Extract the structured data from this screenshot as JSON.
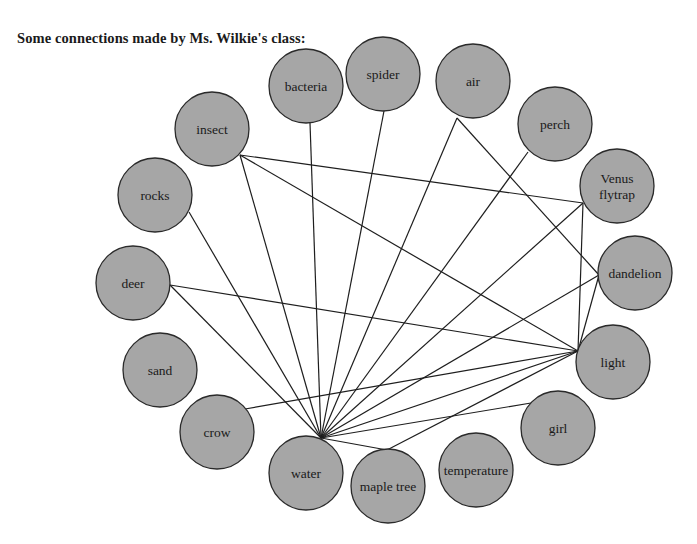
{
  "title": "Some connections made by Ms. Wilkie's class:",
  "colors": {
    "node_fill": "#a6a6a6",
    "node_stroke": "#2a2a2a",
    "edge": "#1e1e1e"
  },
  "nodes": [
    {
      "id": "bacteria",
      "label": "bacteria",
      "cx": 306,
      "cy": 86,
      "r": 37
    },
    {
      "id": "spider",
      "label": "spider",
      "cx": 383,
      "cy": 74,
      "r": 37
    },
    {
      "id": "air",
      "label": "air",
      "cx": 473,
      "cy": 81,
      "r": 37
    },
    {
      "id": "perch",
      "label": "perch",
      "cx": 555,
      "cy": 124,
      "r": 37
    },
    {
      "id": "insect",
      "label": "insect",
      "cx": 212,
      "cy": 129,
      "r": 37
    },
    {
      "id": "venus-flytrap",
      "label": "Venus flytrap",
      "lines": [
        "Venus",
        "flytrap"
      ],
      "cx": 617,
      "cy": 186,
      "r": 37
    },
    {
      "id": "rocks",
      "label": "rocks",
      "cx": 155,
      "cy": 195,
      "r": 37
    },
    {
      "id": "dandelion",
      "label": "dandelion",
      "cx": 635,
      "cy": 273,
      "r": 37
    },
    {
      "id": "deer",
      "label": "deer",
      "cx": 133,
      "cy": 283,
      "r": 37
    },
    {
      "id": "light",
      "label": "light",
      "cx": 613,
      "cy": 362,
      "r": 37
    },
    {
      "id": "sand",
      "label": "sand",
      "cx": 160,
      "cy": 370,
      "r": 37
    },
    {
      "id": "girl",
      "label": "girl",
      "cx": 558,
      "cy": 428,
      "r": 37
    },
    {
      "id": "crow",
      "label": "crow",
      "cx": 217,
      "cy": 432,
      "r": 37
    },
    {
      "id": "water",
      "label": "water",
      "cx": 306,
      "cy": 473,
      "r": 37
    },
    {
      "id": "maple-tree",
      "label": "maple tree",
      "cx": 388,
      "cy": 486,
      "r": 37
    },
    {
      "id": "temperature",
      "label": "temperature",
      "cx": 476,
      "cy": 470,
      "r": 37
    }
  ],
  "edges": [
    {
      "from": "bacteria",
      "to": "water",
      "x1": 310,
      "y1": 123,
      "x2": 321,
      "y2": 438
    },
    {
      "from": "spider",
      "to": "water",
      "x1": 384,
      "y1": 111,
      "x2": 321,
      "y2": 438
    },
    {
      "from": "air",
      "to": "water",
      "x1": 457,
      "y1": 118,
      "x2": 321,
      "y2": 438
    },
    {
      "from": "air",
      "to": "dandelion",
      "x1": 457,
      "y1": 118,
      "x2": 599,
      "y2": 275
    },
    {
      "from": "perch",
      "to": "water",
      "x1": 528,
      "y1": 152,
      "x2": 321,
      "y2": 438
    },
    {
      "from": "insect",
      "to": "water",
      "x1": 240,
      "y1": 155,
      "x2": 321,
      "y2": 438
    },
    {
      "from": "insect",
      "to": "venus-flytrap",
      "x1": 240,
      "y1": 155,
      "x2": 583,
      "y2": 203
    },
    {
      "from": "insect",
      "to": "light",
      "x1": 240,
      "y1": 155,
      "x2": 578,
      "y2": 351
    },
    {
      "from": "venus-flytrap",
      "to": "water",
      "x1": 583,
      "y1": 203,
      "x2": 321,
      "y2": 438
    },
    {
      "from": "venus-flytrap",
      "to": "light",
      "x1": 583,
      "y1": 203,
      "x2": 578,
      "y2": 351
    },
    {
      "from": "rocks",
      "to": "water",
      "x1": 189,
      "y1": 212,
      "x2": 321,
      "y2": 438
    },
    {
      "from": "dandelion",
      "to": "water",
      "x1": 599,
      "y1": 275,
      "x2": 321,
      "y2": 438
    },
    {
      "from": "dandelion",
      "to": "light",
      "x1": 599,
      "y1": 275,
      "x2": 578,
      "y2": 351
    },
    {
      "from": "deer",
      "to": "light",
      "x1": 170,
      "y1": 285,
      "x2": 578,
      "y2": 351
    },
    {
      "from": "deer",
      "to": "water",
      "x1": 170,
      "y1": 285,
      "x2": 321,
      "y2": 438
    },
    {
      "from": "light",
      "to": "water",
      "x1": 578,
      "y1": 351,
      "x2": 321,
      "y2": 438
    },
    {
      "from": "crow",
      "to": "light",
      "x1": 245,
      "y1": 409,
      "x2": 578,
      "y2": 351
    },
    {
      "from": "girl",
      "to": "water",
      "x1": 531,
      "y1": 403,
      "x2": 321,
      "y2": 438
    },
    {
      "from": "maple-tree",
      "to": "water",
      "x1": 387,
      "y1": 450,
      "x2": 321,
      "y2": 438
    },
    {
      "from": "maple-tree",
      "to": "light",
      "x1": 387,
      "y1": 450,
      "x2": 578,
      "y2": 351
    }
  ]
}
